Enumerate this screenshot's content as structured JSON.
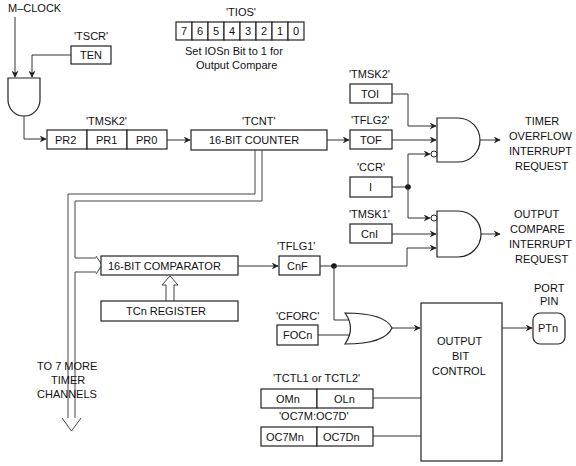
{
  "inputs": {
    "clock": "M–CLOCK"
  },
  "registers": {
    "tscr": {
      "name": "'TSCR'",
      "bits": [
        "TEN"
      ]
    },
    "tios": {
      "name": "'TIOS'",
      "bits": [
        "7",
        "6",
        "5",
        "4",
        "3",
        "2",
        "1",
        "0"
      ],
      "note_line1": "Set IOSn Bit to 1 for",
      "note_line2": "Output Compare"
    },
    "tmsk2_prescale": {
      "name": "'TMSK2'",
      "bits": [
        "PR2",
        "PR1",
        "PR0"
      ]
    },
    "tcnt": {
      "name": "'TCNT'",
      "label": "16-BIT COUNTER"
    },
    "tmsk2_toi": {
      "name": "'TMSK2'",
      "bits": [
        "TOI"
      ]
    },
    "tflg2": {
      "name": "'TFLG2'",
      "bits": [
        "TOF"
      ]
    },
    "ccr": {
      "name": "'CCR'",
      "bits": [
        "I"
      ]
    },
    "tmsk1": {
      "name": "'TMSK1'",
      "bits": [
        "CnI"
      ]
    },
    "tflg1": {
      "name": "'TFLG1'",
      "bits": [
        "CnF"
      ]
    },
    "comparator": {
      "label": "16-BIT COMPARATOR"
    },
    "tcn": {
      "label": "TCn REGISTER"
    },
    "cforc": {
      "name": "'CFORC'",
      "bits": [
        "FOCn"
      ]
    },
    "tctl": {
      "name": "'TCTL1 or TCTL2'",
      "bits": [
        "OMn",
        "OLn"
      ]
    },
    "oc7": {
      "name": "'OC7M:OC7D'",
      "bits": [
        "OC7Mn",
        "OC7Dn"
      ]
    }
  },
  "blocks": {
    "output_bit_control": [
      "OUTPUT",
      "BIT",
      "CONTROL"
    ],
    "port_pin_label": [
      "PORT",
      "PIN"
    ],
    "port_pin": "PTn"
  },
  "outputs": {
    "timer_overflow": [
      "TIMER",
      "OVERFLOW",
      "INTERRUPT",
      "REQUEST"
    ],
    "output_compare": [
      "OUTPUT",
      "COMPARE",
      "INTERRUPT",
      "REQUEST"
    ],
    "more_channels": [
      "TO 7 MORE",
      "TIMER",
      "CHANNELS"
    ]
  }
}
